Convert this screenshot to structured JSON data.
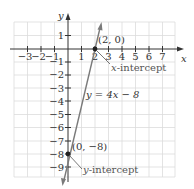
{
  "diagram": {
    "type": "coordinate-graph",
    "equation_label": "y = 4x − 8",
    "axes": {
      "x_label": "x",
      "y_label": "y",
      "x_ticks": [
        "−3",
        "−2",
        "−1",
        "1",
        "2",
        "3",
        "4",
        "5",
        "6",
        "7"
      ],
      "y_ticks": [
        "1",
        "−1",
        "−2",
        "−3",
        "−4",
        "−5",
        "−6",
        "−7",
        "−8",
        "−9"
      ],
      "x_range": [
        -4,
        8
      ],
      "y_range": [
        -10,
        2
      ]
    },
    "points": [
      {
        "label": "(2, 0)",
        "x": 2,
        "y": 0,
        "annotation": "x-intercept"
      },
      {
        "label": "(0, −8)",
        "x": 0,
        "y": -8,
        "annotation": "y-intercept"
      }
    ],
    "colors": {
      "line": "#777777",
      "grid": "#d8d8d8",
      "axis": "#333333",
      "point": "#222222"
    }
  }
}
